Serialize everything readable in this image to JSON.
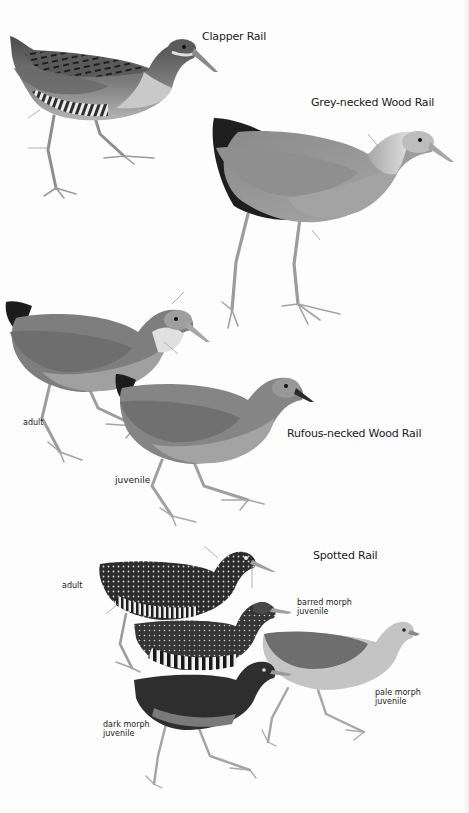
{
  "plate": {
    "background": "#fdfdfd",
    "species": [
      {
        "name": "Clapper Rail",
        "figures": []
      },
      {
        "name": "Grey-necked Wood Rail",
        "figures": []
      },
      {
        "name": "Rufous-necked Wood Rail",
        "figures": [
          {
            "caption": "adult"
          },
          {
            "caption": "juvenile"
          }
        ]
      },
      {
        "name": "Spotted Rail",
        "figures": [
          {
            "caption": "adult"
          },
          {
            "caption_line1": "barred morph",
            "caption_line2": "juvenile"
          },
          {
            "caption_line1": "pale morph",
            "caption_line2": "juvenile"
          },
          {
            "caption_line1": "dark morph",
            "caption_line2": "juvenile"
          }
        ]
      }
    ]
  }
}
